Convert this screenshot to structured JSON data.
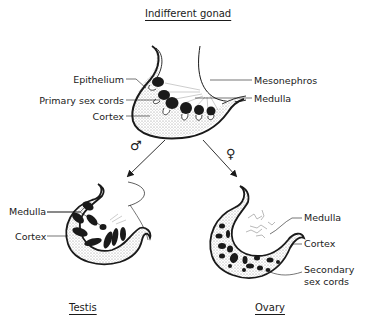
{
  "diagram": {
    "title": "Indifferent gonad",
    "top_labels": {
      "epithelium": "Epithelium",
      "primary_sex_cords": "Primary sex cords",
      "cortex": "Cortex",
      "mesonephros": "Mesonephros",
      "medulla": "Medulla"
    },
    "branches": {
      "male_symbol": "♂",
      "female_symbol": "♀"
    },
    "testis": {
      "title": "Testis",
      "labels": {
        "medulla": "Medulla",
        "cortex": "Cortex"
      }
    },
    "ovary": {
      "title": "Ovary",
      "labels": {
        "medulla": "Medulla",
        "cortex": "Cortex",
        "secondary_sex_cords_line1": "Secondary",
        "secondary_sex_cords_line2": "sex cords"
      }
    },
    "colors": {
      "ink": "#1a1a1a",
      "stipple": "#bdbdbd",
      "background": "#ffffff"
    }
  }
}
